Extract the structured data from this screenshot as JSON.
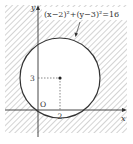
{
  "diagram": {
    "equation_label": "(x−2)²+(y−3)²=16",
    "axis_x_label": "x",
    "axis_y_label": "y",
    "origin_label": "O",
    "center_x_tick": "2",
    "center_y_tick": "3",
    "colors": {
      "stroke": "#333333",
      "hatch": "#b5b5b5",
      "background": "#ffffff"
    },
    "circle": {
      "center": [
        2,
        3
      ],
      "radius": 4
    },
    "shaded_region": "outside circle"
  }
}
